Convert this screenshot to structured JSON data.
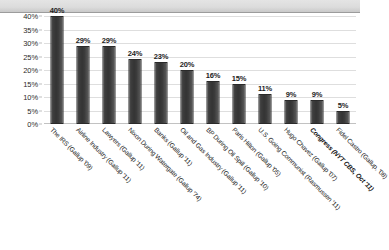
{
  "chart_data": {
    "type": "bar",
    "title": "",
    "subtitle": "",
    "xlabel": "",
    "ylabel": "",
    "ylim": [
      0,
      40
    ],
    "ytick_step": 5,
    "grid": true,
    "legend": "none",
    "value_labels": true,
    "categories": [
      "The IRS (Gallup '09)",
      "Airline Industry (Gallup '11)",
      "Lawyers (Gallup '11)",
      "Nixon During Watergate (Gallup '74)",
      "Banks (Gallup '11)",
      "Oil and Gas Industry (Gallup '11)",
      "BP During Oil Spill (Gallup '10)",
      "Paris Hilton (Gallup '05)",
      "U.S. Going Communist (Rasmussen '11)",
      "Hugo Chavez (Gallup '07)",
      "Congress (NYT CBS, Oct '11)",
      "Fidel Castro (Gallup, '08)"
    ],
    "values": [
      40,
      29,
      29,
      24,
      23,
      20,
      16,
      15,
      11,
      9,
      9,
      5
    ],
    "value_label_texts": [
      "40%",
      "29%",
      "29%",
      "24%",
      "23%",
      "20%",
      "16%",
      "15%",
      "11%",
      "9%",
      "9%",
      "5%"
    ],
    "emphasized_categories": [
      "Congress (NYT CBS, Oct '11)"
    ],
    "ytick_labels": [
      "40%",
      "35%",
      "30%",
      "25%",
      "20%",
      "15%",
      "10%",
      "5%",
      "0%"
    ],
    "ytick_values": [
      40,
      35,
      30,
      25,
      20,
      15,
      10,
      5,
      0
    ],
    "colors": {
      "bar": "#3a3a3a",
      "bar_edge": "#2a2a2a",
      "gridline": "#dedede",
      "axis": "#c2c2c2",
      "text": "#232323",
      "background": "#ffffff",
      "top_band": "#dcdcdc"
    }
  }
}
